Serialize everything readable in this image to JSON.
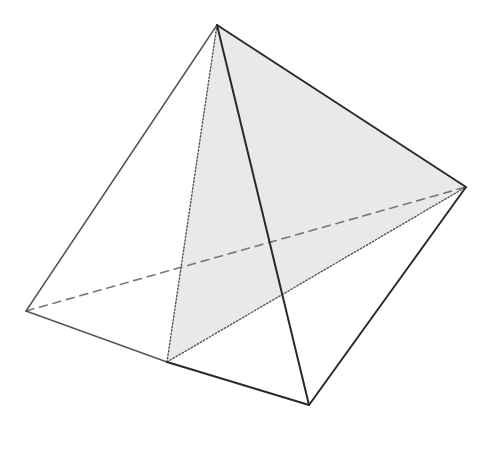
{
  "diagram": {
    "type": "3d-solid-wireframe",
    "colors": {
      "background": "#ffffff",
      "front_edge": "#2a2a2a",
      "back_edge": "#555555",
      "hidden_edge": "#777777",
      "section_fill": "#e9e9e9"
    },
    "vertices": {
      "A": [
        217,
        25
      ],
      "B": [
        466,
        187
      ],
      "C": [
        26,
        311
      ],
      "D": [
        167,
        362
      ],
      "E": [
        309,
        405
      ]
    },
    "shaded_faces": [
      {
        "points": [
          "A",
          "D",
          "B"
        ]
      }
    ],
    "edges": [
      {
        "from": "A",
        "to": "C",
        "style": "solid",
        "weight": "light"
      },
      {
        "from": "A",
        "to": "B",
        "style": "solid",
        "weight": "dark"
      },
      {
        "from": "A",
        "to": "E",
        "style": "solid",
        "weight": "dark"
      },
      {
        "from": "A",
        "to": "D",
        "style": "dotted",
        "weight": "dark"
      },
      {
        "from": "C",
        "to": "D",
        "style": "solid",
        "weight": "light"
      },
      {
        "from": "D",
        "to": "E",
        "style": "solid",
        "weight": "dark"
      },
      {
        "from": "E",
        "to": "B",
        "style": "solid",
        "weight": "dark"
      },
      {
        "from": "C",
        "to": "B",
        "style": "dashed",
        "weight": "light"
      },
      {
        "from": "D",
        "to": "B",
        "style": "dotted",
        "weight": "dark"
      }
    ]
  }
}
